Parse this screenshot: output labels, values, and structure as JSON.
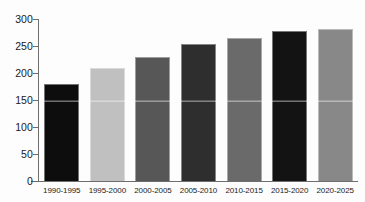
{
  "chart_data": {
    "type": "bar",
    "title": "",
    "subtitle": "",
    "xlabel": "",
    "ylabel": "",
    "categories": [
      "1990-1995",
      "1995-2000",
      "2000-2005",
      "2005-2010",
      "2010-2015",
      "2015-2020",
      "2020-2025"
    ],
    "values": [
      180,
      210,
      230,
      253,
      265,
      277,
      281
    ],
    "bar_colors": [
      "#0d0d0d",
      "#c0c0c0",
      "#575757",
      "#2e2e2e",
      "#6a6a6a",
      "#131313",
      "#888888"
    ],
    "ylim": [
      0,
      300
    ],
    "yticks": [
      0,
      50,
      100,
      150,
      200,
      250,
      300
    ],
    "ytick_labels": [
      "0",
      "50",
      "100",
      "150",
      "200",
      "250",
      "300"
    ],
    "xtick_labels": [
      "1990-1995",
      "1995-2000",
      "2000-2005",
      "2005-2010",
      "2010-2015",
      "2015-2020",
      "2020-2025"
    ],
    "grid": false,
    "legend": false,
    "legend_position": "none",
    "annotations": [],
    "axis_color": "#6e6e6e",
    "background_color": "#fdfdfd",
    "text_color": "#1a1a1a"
  }
}
